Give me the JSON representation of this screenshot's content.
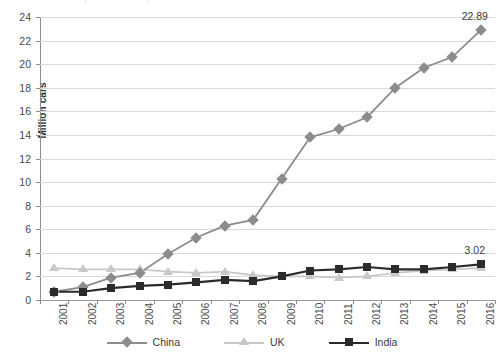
{
  "title_sliver": "Chinese car production compared with the UK and India",
  "axes": {
    "ylabel": "Million cars",
    "yticks": [
      0,
      2,
      4,
      6,
      8,
      10,
      12,
      14,
      16,
      18,
      20,
      22,
      24
    ],
    "ymin": 0,
    "ymax": 24
  },
  "legend": {
    "items": [
      {
        "label": "China",
        "marker": "diamond-marker",
        "color": "#8c8c8c"
      },
      {
        "label": "UK",
        "marker": "triangle-marker",
        "color": "#c8c8c8"
      },
      {
        "label": "India",
        "marker": "square-marker",
        "color": "#2b2b2b"
      }
    ]
  },
  "annotations": [
    {
      "name": "china-2016-value-label",
      "text": "22.89"
    },
    {
      "name": "india-2016-value-label",
      "text": "3.02"
    }
  ],
  "chart_data": {
    "type": "line",
    "title": "Chinese car production compared with the UK and India",
    "xlabel": "",
    "ylabel": "Million cars",
    "ylim": [
      0,
      24
    ],
    "ytick_step": 2,
    "grid": true,
    "legend_position": "bottom",
    "categories": [
      "2001",
      "2002",
      "2003",
      "2004",
      "2005",
      "2006",
      "2007",
      "2008",
      "2009",
      "2010",
      "2011",
      "2012",
      "2013",
      "2014",
      "2015",
      "2016"
    ],
    "series": [
      {
        "name": "China",
        "color": "#8c8c8c",
        "marker": "diamond",
        "values": [
          0.7,
          1.1,
          1.9,
          2.3,
          3.9,
          5.3,
          6.3,
          6.8,
          10.3,
          13.8,
          14.5,
          15.5,
          18.0,
          19.7,
          20.6,
          22.89
        ],
        "data_labels": {
          "2016": "22.89"
        }
      },
      {
        "name": "UK",
        "color": "#c8c8c8",
        "marker": "triangle",
        "values": [
          2.7,
          2.6,
          2.6,
          2.6,
          2.4,
          2.3,
          2.4,
          2.1,
          2.0,
          2.0,
          1.9,
          2.0,
          2.3,
          2.5,
          2.6,
          2.7
        ],
        "data_labels": {}
      },
      {
        "name": "India",
        "color": "#2b2b2b",
        "marker": "square",
        "values": [
          0.7,
          0.7,
          1.0,
          1.2,
          1.3,
          1.5,
          1.7,
          1.6,
          2.0,
          2.5,
          2.6,
          2.8,
          2.6,
          2.6,
          2.8,
          3.02
        ],
        "data_labels": {
          "2016": "3.02"
        }
      }
    ]
  }
}
